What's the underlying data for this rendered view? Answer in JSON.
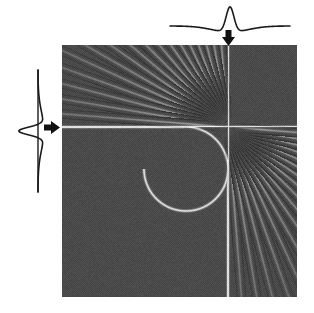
{
  "figure": {
    "name": "separable-filter-on-rounded-corner-edge",
    "caption": "Sharpening (Mexican-hat) kernel applied separately along the horizontal and the vertical axis of a rounded-corner edge test image.",
    "background_color": "#ffffff",
    "width": 314,
    "height": 313
  },
  "image_panel": {
    "label": "filtered-test-image",
    "x": 62,
    "y": 45,
    "width": 235,
    "height": 252,
    "background_gray": "#4a4a4a",
    "halftone": true,
    "center": {
      "x": 166,
      "y": 82
    },
    "features": {
      "horizontal_edge_label": "horizontal bright edge",
      "vertical_edge_label": "vertical bright edge",
      "corner_arc_label": "rounded corner arc",
      "corner_radius": 42,
      "ringing_label": "radiating ringing streaks"
    },
    "streaks": {
      "upper_left_count": 17,
      "lower_right_count": 17,
      "upper_left_angle_start": 182,
      "upper_left_angle_end": 268,
      "lower_right_angle_start": 2,
      "lower_right_angle_end": 88
    }
  },
  "top_profile": {
    "label": "horizontal-kernel-profile",
    "description": "1-D sharpening kernel: tall central positive peak with two negative side lobes, long flat tails.",
    "x": 168,
    "y": 10,
    "width": 120,
    "height": 28,
    "peak_x": 228,
    "baseline_y": 26,
    "peak_height": 20,
    "lobe_depth": 6,
    "stroke_color": "#1a1a1a"
  },
  "left_profile": {
    "label": "vertical-kernel-profile",
    "description": "Same 1-D sharpening kernel rotated 90 degrees, peak pointing toward the image.",
    "x": 20,
    "y": 68,
    "width": 28,
    "height": 122,
    "peak_y": 127,
    "baseline_x": 38,
    "peak_height": 20,
    "lobe_depth": 6,
    "stroke_color": "#1a1a1a"
  },
  "top_arrow": {
    "label": "down-arrow",
    "direction": "down",
    "x": 228,
    "y": 30,
    "length": 16,
    "color": "#111111"
  },
  "left_arrow": {
    "label": "right-arrow",
    "direction": "right",
    "x": 44,
    "y": 127,
    "length": 16,
    "color": "#111111"
  }
}
